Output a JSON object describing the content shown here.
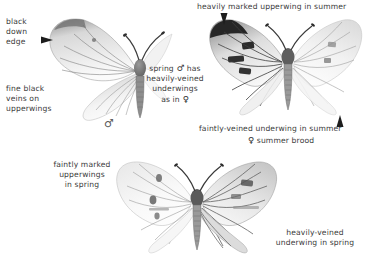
{
  "plate": {
    "title": "Green-veined White butterfly seasonal forms plate",
    "background_color": "#ffffff",
    "text_color": "#3a3a3a",
    "width": 375,
    "height": 262
  },
  "labels": {
    "black_down_edge": {
      "line1": "black",
      "line2": "down",
      "line3": "edge"
    },
    "fine_black_veins": {
      "line1": "fine black",
      "line2": "veins on",
      "line3": "upperwings"
    },
    "spring_male": {
      "line1_a": "spring",
      "line1_sym": "♂",
      "line1_b": "has",
      "line2": "heavily-veined",
      "line3": "underwings",
      "line4_a": "as in",
      "line4_sym": "♀"
    },
    "heavily_marked_upperwing": {
      "text": "heavily marked upperwing in summer"
    },
    "faintly_veined_underwing": {
      "text": "faintly-veined underwing in summer"
    },
    "summer_brood": {
      "sym": "♀",
      "text": "summer brood"
    },
    "faintly_marked_upperwings": {
      "line1": "faintly marked",
      "line2": "upperwings",
      "line3": "in spring"
    },
    "heavily_veined_underwing_spring": {
      "line1": "heavily-veined",
      "line2": "underwing in spring"
    }
  },
  "symbols": {
    "male_spring_specimen": "♂"
  },
  "specimens": [
    {
      "name": "spring-male-butterfly",
      "caption_symbol": "♂",
      "season": "spring",
      "sex": "male"
    },
    {
      "name": "summer-female-butterfly",
      "caption_symbol": "♀",
      "season": "summer",
      "sex": "female"
    },
    {
      "name": "spring-brood-butterfly",
      "caption_symbol": "",
      "season": "spring",
      "sex": ""
    }
  ],
  "arrows": [
    {
      "name": "arrow-black-down-edge",
      "direction": "right"
    },
    {
      "name": "arrow-heavily-marked-upperwing",
      "direction": "down"
    },
    {
      "name": "arrow-faintly-veined-underwing",
      "direction": "up"
    }
  ]
}
